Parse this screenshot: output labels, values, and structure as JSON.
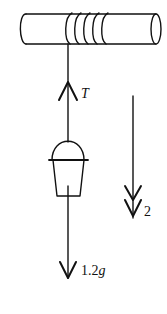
{
  "diagram": {
    "type": "physics-free-body",
    "colors": {
      "stroke": "#111111",
      "background": "#ffffff"
    },
    "cylinder": {
      "label": ""
    },
    "forces": [
      {
        "name": "tension",
        "direction": "up",
        "label": "T",
        "label_italic": true
      },
      {
        "name": "weight",
        "direction": "down",
        "label_number": "1.2",
        "label_symbol": "g"
      }
    ],
    "acceleration": {
      "direction": "down",
      "label": "2",
      "arrow_style": "double-arrowhead"
    }
  }
}
